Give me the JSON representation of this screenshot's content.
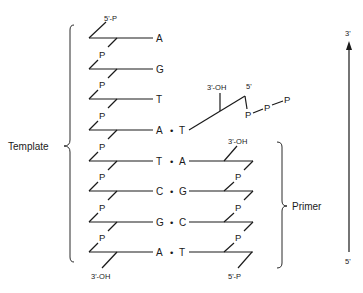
{
  "diagram": {
    "template": {
      "label": "Template",
      "top_end": "5'-P",
      "bottom_end": "3'-OH",
      "bases": [
        "A",
        "G",
        "T",
        "A",
        "T",
        "C",
        "G",
        "A"
      ],
      "phosphate": "P"
    },
    "primer": {
      "label": "Primer",
      "top_end": "3'-OH",
      "bottom_end": "5'-P",
      "bases": [
        "A",
        "G",
        "C",
        "T"
      ],
      "phosphate": "P"
    },
    "incoming_nucleotide": {
      "base": "T",
      "sugar_3_end": "3'-OH",
      "sugar_5_end": "5'",
      "triphosphate": [
        "P",
        "P",
        "P"
      ]
    },
    "pair_dot": "•",
    "direction_arrow": {
      "top": "3'",
      "bottom": "5'"
    }
  }
}
